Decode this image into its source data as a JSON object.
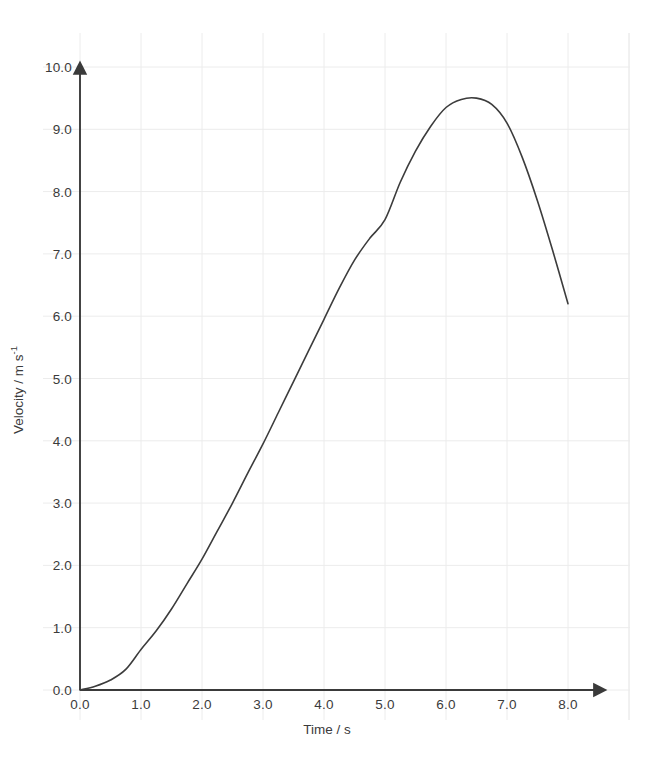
{
  "chart_data": {
    "type": "line",
    "title": "",
    "xlabel": "Time / s",
    "ylabel_text": "Velocity / m s",
    "ylabel_sup": "-1",
    "ylabel": "Velocity / m s-1",
    "xlim": [
      0.0,
      8.0
    ],
    "ylim": [
      0.0,
      10.0
    ],
    "xticks": [
      "0.0",
      "1.0",
      "2.0",
      "3.0",
      "4.0",
      "5.0",
      "6.0",
      "7.0",
      "8.0"
    ],
    "yticks": [
      "0.0",
      "1.0",
      "2.0",
      "3.0",
      "4.0",
      "5.0",
      "6.0",
      "7.0",
      "8.0",
      "9.0",
      "10.0"
    ],
    "xtick_values": [
      0.0,
      1.0,
      2.0,
      3.0,
      4.0,
      5.0,
      6.0,
      7.0,
      8.0
    ],
    "ytick_values": [
      0.0,
      1.0,
      2.0,
      3.0,
      4.0,
      5.0,
      6.0,
      7.0,
      8.0,
      9.0,
      10.0
    ],
    "grid": true,
    "grid_color": "#ececec",
    "axis_color": "#3a3a3a",
    "line_color": "#3c3c3c",
    "line_width": 1.6,
    "legend": null,
    "series": [
      {
        "name": "velocity",
        "x": [
          0.0,
          0.25,
          0.5,
          0.75,
          1.0,
          1.25,
          1.5,
          1.75,
          2.0,
          2.25,
          2.5,
          2.75,
          3.0,
          3.25,
          3.5,
          3.75,
          4.0,
          4.25,
          4.5,
          4.75,
          5.0,
          5.25,
          5.5,
          5.75,
          6.0,
          6.25,
          6.5,
          6.75,
          7.0,
          7.25,
          7.5,
          7.75,
          8.0
        ],
        "values": [
          0.0,
          0.06,
          0.16,
          0.33,
          0.65,
          0.95,
          1.3,
          1.7,
          2.1,
          2.55,
          3.0,
          3.48,
          3.95,
          4.45,
          4.95,
          5.45,
          5.95,
          6.45,
          6.9,
          7.25,
          7.55,
          8.15,
          8.65,
          9.05,
          9.35,
          9.48,
          9.5,
          9.4,
          9.1,
          8.55,
          7.85,
          7.05,
          6.2
        ]
      }
    ],
    "annotations": {
      "peak_time": 6.5,
      "peak_velocity": 9.5,
      "end_time": 8.0,
      "end_velocity": 6.2
    }
  },
  "geometry": {
    "plot_left": 80,
    "plot_bottom": 690,
    "plot_top": 67,
    "px_per_x": 61.0,
    "px_per_y": 62.3,
    "grid_x_start": 43,
    "grid_x_end": 630,
    "grid_y_start": 33,
    "grid_y_end": 720
  }
}
